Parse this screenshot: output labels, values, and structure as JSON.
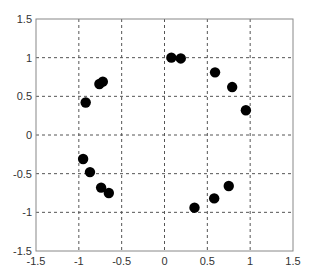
{
  "chart_data": {
    "type": "scatter",
    "title": "",
    "xlabel": "",
    "ylabel": "",
    "xlim": [
      -1.5,
      1.5
    ],
    "ylim": [
      -1.5,
      1.5
    ],
    "xticks": [
      -1.5,
      -1,
      -0.5,
      0,
      0.5,
      1,
      1.5
    ],
    "yticks": [
      -1.5,
      -1,
      -0.5,
      0,
      0.5,
      1,
      1.5
    ],
    "xtick_labels": [
      "-1.5",
      "-1",
      "-0.5",
      "0",
      "0.5",
      "1",
      "1.5"
    ],
    "ytick_labels": [
      "-1.5",
      "-1",
      "-0.5",
      "0",
      "0.5",
      "1",
      "1.5"
    ],
    "grid": true,
    "grid_style": "dashed",
    "legend": null,
    "series": [
      {
        "name": "points",
        "marker": "filled-circle",
        "color": "#000000",
        "points": [
          {
            "x": -0.92,
            "y": 0.42
          },
          {
            "x": -0.76,
            "y": 0.66
          },
          {
            "x": -0.72,
            "y": 0.69
          },
          {
            "x": 0.08,
            "y": 1.0
          },
          {
            "x": 0.19,
            "y": 0.99
          },
          {
            "x": 0.59,
            "y": 0.81
          },
          {
            "x": 0.79,
            "y": 0.62
          },
          {
            "x": 0.95,
            "y": 0.32
          },
          {
            "x": -0.95,
            "y": -0.31
          },
          {
            "x": -0.87,
            "y": -0.48
          },
          {
            "x": -0.74,
            "y": -0.68
          },
          {
            "x": -0.65,
            "y": -0.75
          },
          {
            "x": 0.35,
            "y": -0.94
          },
          {
            "x": 0.58,
            "y": -0.82
          },
          {
            "x": 0.75,
            "y": -0.66
          }
        ]
      }
    ]
  },
  "colors": {
    "axis": "#888888",
    "grid": "#555555",
    "marker": "#000000",
    "background": "#ffffff"
  }
}
